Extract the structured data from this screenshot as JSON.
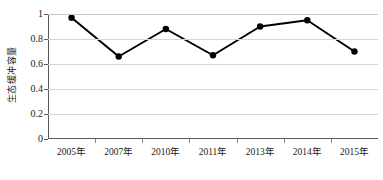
{
  "chart_data": {
    "type": "line",
    "title": "",
    "subtitle": "",
    "xlabel": "",
    "ylabel": "生态缓冲容量",
    "categories": [
      "2005年",
      "2007年",
      "2010年",
      "2011年",
      "2013年",
      "2014年",
      "2015年"
    ],
    "values": [
      0.97,
      0.66,
      0.88,
      0.67,
      0.9,
      0.95,
      0.7
    ],
    "series": [
      {
        "name": "生态缓冲容量",
        "values": [
          0.97,
          0.66,
          0.88,
          0.67,
          0.9,
          0.95,
          0.7
        ]
      }
    ],
    "ylim": [
      0,
      1
    ],
    "y_ticks": [
      0,
      0.2,
      0.4,
      0.6,
      0.8,
      1
    ],
    "y_tick_labels": [
      "0",
      "0.2",
      "0.4",
      "0.6",
      "0.8",
      "1"
    ],
    "grid": "horizontal",
    "legend": "none",
    "marker": "filled-circle",
    "colors": {
      "line": "#000000",
      "marker": "#000000",
      "gridline": "#d6d6d6",
      "axis": "#5a5a5a",
      "background": "#ffffff",
      "text": "#1a1a1a"
    }
  }
}
